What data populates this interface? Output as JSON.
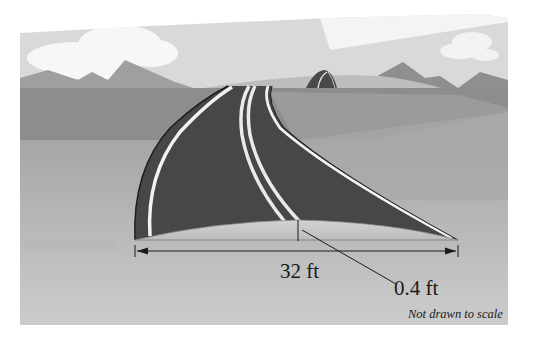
{
  "figure": {
    "labels": {
      "width": "32 ft",
      "crown_height": "0.4 ft",
      "note": "Not drawn to scale"
    },
    "measurements": {
      "road_width_ft": 32,
      "crown_height_ft": 0.4
    },
    "colors": {
      "sky": "#d8d8d8",
      "cloud": "#f7f7f7",
      "mountain": "#9a9a9a",
      "far_hill": "#b9b9b9",
      "plain_far": "#8c8c8c",
      "plain_mid": "#a3a3a3",
      "plain_near": "#bdbdbd",
      "road": "#4a4a4a",
      "road_line": "#f0f0f0",
      "crown_face": "#c9c9c9",
      "ink": "#1a1a1a"
    }
  }
}
